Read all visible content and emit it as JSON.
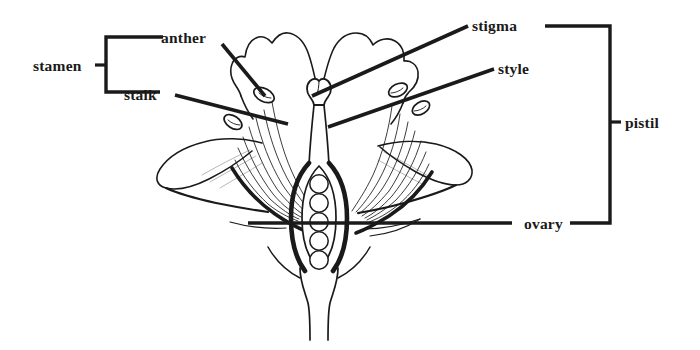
{
  "diagram": {
    "view": "longitudinal section",
    "background_color": "#ffffff",
    "ink_color": "#1a1a1a",
    "labels": {
      "stamen": "stamen",
      "anther": "anther",
      "stalk": "stalk",
      "stigma": "stigma",
      "style": "style",
      "ovary": "ovary",
      "pistil": "pistil"
    },
    "groups": [
      {
        "name": "stamen",
        "label": "stamen",
        "side": "left",
        "members": [
          "anther",
          "stalk"
        ]
      },
      {
        "name": "pistil",
        "label": "pistil",
        "side": "right",
        "members": [
          "stigma",
          "style",
          "ovary"
        ]
      }
    ],
    "parts": [
      {
        "id": "anther",
        "label": "anther",
        "group": "stamen"
      },
      {
        "id": "stalk",
        "label": "stalk",
        "group": "stamen"
      },
      {
        "id": "stigma",
        "label": "stigma",
        "group": "pistil"
      },
      {
        "id": "style",
        "label": "style",
        "group": "pistil"
      },
      {
        "id": "ovary",
        "label": "ovary",
        "group": "pistil"
      }
    ],
    "ovule_count": 5
  }
}
